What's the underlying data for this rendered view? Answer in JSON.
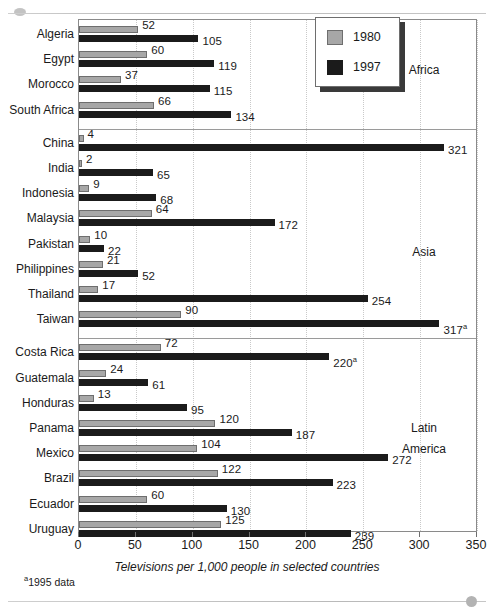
{
  "chart_data": {
    "type": "bar",
    "orientation": "horizontal",
    "title": "",
    "xlabel": "Televisions per 1,000 people in selected countries",
    "ylabel": "",
    "xlim": [
      0,
      350
    ],
    "xticks": [
      0,
      50,
      100,
      150,
      200,
      250,
      300,
      350
    ],
    "grid": "vertical-dotted",
    "legend_position": "top-right",
    "legend": [
      "1980",
      "1997"
    ],
    "series": [
      {
        "name": "1980",
        "color": "#a7a7a7"
      },
      {
        "name": "1997",
        "color": "#1b1b1b"
      }
    ],
    "groups": [
      {
        "name": "Africa",
        "categories": [
          "Algeria",
          "Egypt",
          "Morocco",
          "South Africa"
        ],
        "values_1980": [
          52,
          60,
          37,
          66
        ],
        "values_1997": [
          105,
          119,
          115,
          134
        ],
        "labels_1980": [
          "52",
          "60",
          "37",
          "66"
        ],
        "labels_1997": [
          "105",
          "119",
          "115",
          "134"
        ]
      },
      {
        "name": "Asia",
        "categories": [
          "China",
          "India",
          "Indonesia",
          "Malaysia",
          "Pakistan",
          "Philippines",
          "Thailand",
          "Taiwan"
        ],
        "values_1980": [
          4,
          2,
          9,
          64,
          10,
          21,
          17,
          90
        ],
        "values_1997": [
          321,
          65,
          68,
          172,
          22,
          52,
          254,
          317
        ],
        "labels_1980": [
          "4",
          "2",
          "9",
          "64",
          "10",
          "21",
          "17",
          "90"
        ],
        "labels_1997": [
          "321",
          "65",
          "68",
          "172",
          "22",
          "52",
          "254",
          "317"
        ],
        "footnote_marks_1997": [
          "",
          "",
          "",
          "",
          "",
          "",
          "",
          "a"
        ]
      },
      {
        "name": "Latin America",
        "categories": [
          "Costa Rica",
          "Guatemala",
          "Honduras",
          "Panama",
          "Mexico",
          "Brazil",
          "Ecuador",
          "Uruguay"
        ],
        "values_1980": [
          72,
          24,
          13,
          120,
          104,
          122,
          60,
          125
        ],
        "values_1997": [
          220,
          61,
          95,
          187,
          272,
          223,
          130,
          239
        ],
        "labels_1980": [
          "72",
          "24",
          "13",
          "120",
          "104",
          "122",
          "60",
          "125"
        ],
        "labels_1997": [
          "220",
          "61",
          "95",
          "187",
          "272",
          "223",
          "130",
          "239"
        ],
        "footnote_marks_1997": [
          "a",
          "",
          "",
          "",
          "",
          "",
          "",
          ""
        ]
      }
    ],
    "footnote": "1995 data",
    "footnote_mark": "a"
  },
  "axis": {
    "tick_0": "0",
    "tick_1": "50",
    "tick_2": "100",
    "tick_3": "150",
    "tick_4": "200",
    "tick_5": "250",
    "tick_6": "300",
    "tick_7": "350",
    "title": "Televisions per 1,000 people in selected countries"
  },
  "legend": {
    "item_1980": "1980",
    "item_1997": "1997"
  },
  "regions": {
    "africa": "Africa",
    "asia": "Asia",
    "latin_line1": "Latin",
    "latin_line2": "America"
  },
  "footnote": {
    "mark": "a",
    "text": "1995 data"
  },
  "colors": {
    "series_1980": "#a7a7a7",
    "series_1997": "#1b1b1b",
    "frame": "#8a8a8a",
    "grid": "#c9c9c9"
  }
}
